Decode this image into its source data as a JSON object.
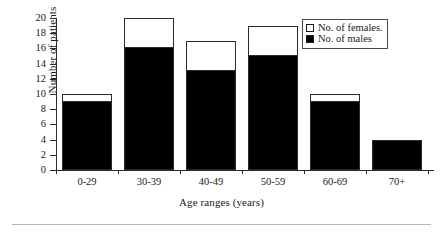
{
  "chart_data": {
    "type": "bar",
    "subtype": "stacked-vertical",
    "title": "",
    "xlabel": "Age ranges (years)",
    "ylabel": "Number of patients",
    "categories": [
      "0-29",
      "30-39",
      "40-49",
      "50-59",
      "60-69",
      "70+"
    ],
    "series": [
      {
        "name": "No. of males",
        "color": "#000000",
        "values": [
          9,
          16,
          13,
          15,
          9,
          4
        ]
      },
      {
        "name": "No. of females.",
        "color": "#ffffff",
        "values": [
          1,
          4,
          4,
          4,
          1,
          0
        ]
      }
    ],
    "totals": [
      10,
      20,
      17,
      19,
      10,
      4
    ],
    "ylim": [
      0,
      20
    ],
    "ytick_values": [
      0,
      2,
      4,
      6,
      8,
      10,
      12,
      14,
      16,
      18,
      20
    ],
    "ytick_labels": [
      "0",
      "2",
      "4",
      "6",
      "8",
      "10",
      "12",
      "14",
      "16",
      "18",
      "20"
    ],
    "grid": false,
    "legend_position": "top-right",
    "legend_entries": [
      "No. of females.",
      "No. of males"
    ]
  },
  "axes": {
    "y_title": "Number of patients",
    "x_title": "Age ranges (years)"
  },
  "legend": {
    "females_label": "No. of females.",
    "males_label": "No. of males",
    "females_color": "#ffffff",
    "males_color": "#000000"
  },
  "colors": {
    "males": "#000000",
    "females": "#ffffff",
    "axis": "#2b2b2b",
    "text": "#1a1a1a",
    "background": "#ffffff",
    "rule": "#b6b6b6"
  }
}
